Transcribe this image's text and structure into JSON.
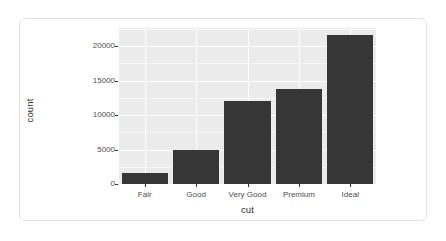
{
  "card": {
    "background_color": "#ffffff",
    "border_color": "#e2e2e2"
  },
  "chart_data": {
    "type": "bar",
    "title": "",
    "subtitle": "",
    "xlabel": "cut",
    "ylabel": "count",
    "categories": [
      "Fair",
      "Good",
      "Very Good",
      "Premium",
      "Ideal"
    ],
    "values": [
      1610,
      4906,
      12082,
      13791,
      21551
    ],
    "ylim": [
      0,
      22600
    ],
    "xlim_note": "discrete categorical axis, 5 levels",
    "y_ticks": [
      0,
      5000,
      10000,
      15000,
      20000
    ],
    "y_tick_labels": [
      "0",
      "5000",
      "10000",
      "15000",
      "20000"
    ],
    "y_minor_ticks": [
      2500,
      7500,
      12500,
      17500,
      22500
    ],
    "grid": true,
    "grid_color_major": "#ffffff",
    "grid_color_minor": "#f7f7f7",
    "panel_background": "#ebebeb",
    "bar_color": "#363636",
    "legend": "none",
    "legend_position": "none",
    "annotations": []
  }
}
